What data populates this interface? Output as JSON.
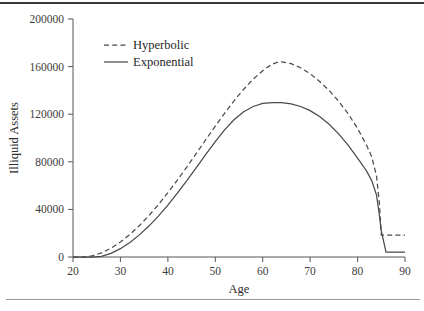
{
  "chart_data": {
    "type": "line",
    "title": "",
    "xlabel": "Age",
    "ylabel": "Illiquid Assets",
    "xlim": [
      20,
      90
    ],
    "ylim": [
      0,
      200000
    ],
    "xticks": [
      20,
      30,
      40,
      50,
      60,
      70,
      80,
      90
    ],
    "xtick_labels": [
      "20",
      "30",
      "40",
      "50",
      "60",
      "70",
      "80",
      "90"
    ],
    "yticks": [
      0,
      40000,
      80000,
      120000,
      160000,
      200000
    ],
    "ytick_labels": [
      "0",
      "40000",
      "80000",
      "120000",
      "160000",
      "200000"
    ],
    "grid": false,
    "legend_position": "upper-left-inside",
    "series": [
      {
        "name": "Hyperbolic",
        "style": "dashed",
        "color": "#4a4a4a",
        "x": [
          20,
          22,
          24,
          26,
          28,
          30,
          32,
          34,
          36,
          38,
          40,
          42,
          44,
          46,
          48,
          50,
          52,
          54,
          56,
          58,
          60,
          61,
          62,
          63,
          64,
          66,
          68,
          70,
          72,
          74,
          76,
          78,
          80,
          82,
          83,
          84,
          84.6,
          85,
          86,
          88,
          90
        ],
        "y": [
          0,
          0,
          900,
          3400,
          7400,
          12600,
          19000,
          26400,
          34800,
          44000,
          54000,
          64600,
          75600,
          87000,
          98600,
          110000,
          121000,
          131500,
          141000,
          149500,
          156500,
          159500,
          162000,
          163500,
          164000,
          162500,
          159000,
          154000,
          147500,
          140000,
          131000,
          120500,
          108000,
          93000,
          84000,
          68000,
          45000,
          18400,
          18400,
          18400,
          18400
        ]
      },
      {
        "name": "Exponential",
        "style": "solid",
        "color": "#4a4a4a",
        "x": [
          20,
          22,
          24,
          26,
          28,
          30,
          32,
          34,
          36,
          38,
          40,
          42,
          44,
          46,
          48,
          50,
          52,
          54,
          56,
          58,
          60,
          62,
          64,
          66,
          68,
          70,
          72,
          74,
          76,
          78,
          80,
          81,
          82,
          83,
          84,
          84.5,
          85,
          86,
          88,
          90
        ],
        "y": [
          0,
          0,
          0,
          600,
          3000,
          7000,
          12200,
          18600,
          26000,
          34400,
          43600,
          53600,
          64200,
          75200,
          86200,
          97000,
          107000,
          115500,
          122000,
          126500,
          129000,
          129800,
          129700,
          128600,
          126500,
          123000,
          118000,
          111500,
          103500,
          94000,
          83000,
          77500,
          71500,
          64000,
          52000,
          38000,
          22000,
          4000,
          4000,
          4000
        ]
      }
    ],
    "annotations": []
  },
  "legend": {
    "items": [
      {
        "label": "Hyperbolic",
        "style": "dashed"
      },
      {
        "label": "Exponential",
        "style": "solid"
      }
    ]
  },
  "axes": {
    "x_title": "Age",
    "y_title": "Illiquid Assets"
  }
}
